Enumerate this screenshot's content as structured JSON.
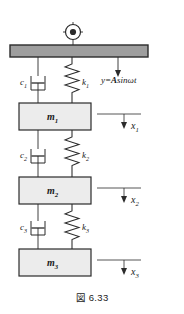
{
  "figure": {
    "caption": "図 6.33",
    "colors": {
      "line": "#2b2b2b",
      "base_fill": "#9e9e9e",
      "mass_fill": "#ececec",
      "background": "#ffffff"
    }
  },
  "support": {
    "icon": "ground-pivot-icon",
    "description": "crosshair pivot symbol on base bar"
  },
  "base": {
    "name": "moving base bar",
    "excitation_label": "y=A sinωt",
    "excitation_parts": {
      "y": "y",
      "eq": "=",
      "amp": "A",
      "fn": "sin",
      "omega": "ω",
      "t": "t"
    }
  },
  "dampers": [
    {
      "label": "c",
      "sub": "1"
    },
    {
      "label": "c",
      "sub": "2"
    },
    {
      "label": "c",
      "sub": "3"
    }
  ],
  "springs": [
    {
      "label": "k",
      "sub": "1"
    },
    {
      "label": "k",
      "sub": "2"
    },
    {
      "label": "k",
      "sub": "3"
    }
  ],
  "masses": [
    {
      "label": "m",
      "sub": "1"
    },
    {
      "label": "m",
      "sub": "2"
    },
    {
      "label": "m",
      "sub": "3"
    }
  ],
  "displacements": [
    {
      "label": "x",
      "sub": "1"
    },
    {
      "label": "x",
      "sub": "2"
    },
    {
      "label": "x",
      "sub": "3"
    }
  ]
}
